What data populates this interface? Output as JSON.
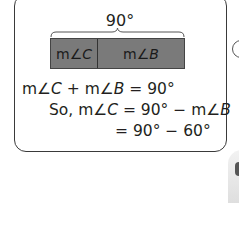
{
  "diagram": {
    "total_label": "90°",
    "bar": {
      "segments": [
        {
          "prefix": "m∠",
          "var": "C"
        },
        {
          "prefix": "m∠",
          "var": "B"
        }
      ],
      "fill_color": "#7a7a7a"
    }
  },
  "equations": {
    "line1": {
      "a": "m∠",
      "b": "C",
      "c": " + m∠",
      "d": "B",
      "e": " = 90°"
    },
    "line2": {
      "a": "So, m∠",
      "b": "C",
      "c": " = 90° − m∠",
      "d": "B"
    },
    "line3": {
      "a": "= 90° − 60°"
    }
  }
}
